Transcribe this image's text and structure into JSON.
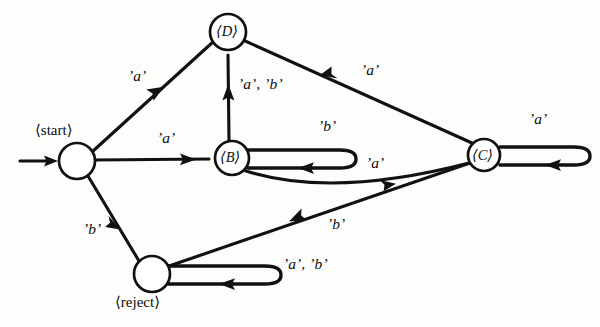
{
  "diagram": {
    "type": "state-diagram",
    "ink_color": "#111111",
    "background_color": "#fdfdfb",
    "states": [
      {
        "id": "start",
        "label": "⟨start⟩",
        "label_text": "start",
        "cx": 77,
        "cy": 161,
        "r": 18,
        "label_pos": "above"
      },
      {
        "id": "D",
        "label": "⟨D⟩",
        "label_text": "D",
        "cx": 228,
        "cy": 32,
        "r": 18,
        "label_pos": "inside"
      },
      {
        "id": "B",
        "label": "⟨B⟩",
        "label_text": "B",
        "cx": 232,
        "cy": 158,
        "r": 17,
        "label_pos": "inside"
      },
      {
        "id": "C",
        "label": "⟨C⟩",
        "label_text": "C",
        "cx": 484,
        "cy": 155,
        "r": 16,
        "label_pos": "inside"
      },
      {
        "id": "reject",
        "label": "⟨reject⟩",
        "label_text": "reject",
        "cx": 152,
        "cy": 274,
        "r": 18,
        "label_pos": "below"
      }
    ],
    "initial_arrow": {
      "from_x": 20,
      "to_x": 58,
      "y": 161
    },
    "transitions": [
      {
        "from": "start",
        "to": "D",
        "label": "’a’",
        "symbols": [
          "a"
        ],
        "label_x": 137,
        "label_y": 76,
        "shape": "straight"
      },
      {
        "from": "start",
        "to": "B",
        "label": "’a’",
        "symbols": [
          "a"
        ],
        "label_x": 166,
        "label_y": 138,
        "shape": "straight"
      },
      {
        "from": "start",
        "to": "reject",
        "label": "’b’",
        "symbols": [
          "b"
        ],
        "label_x": 92,
        "label_y": 229,
        "shape": "straight"
      },
      {
        "from": "B",
        "to": "D",
        "label": "’a’, ’b’",
        "symbols": [
          "a",
          "b"
        ],
        "label_x": 240,
        "label_y": 84,
        "shape": "straight"
      },
      {
        "from": "B",
        "to": "B",
        "label": "’b’",
        "symbols": [
          "b"
        ],
        "label_x": 323,
        "label_y": 126,
        "shape": "self-loop-right"
      },
      {
        "from": "B",
        "to": "C",
        "label": "’a’",
        "symbols": [
          "a"
        ],
        "label_x": 370,
        "label_y": 163,
        "shape": "curve"
      },
      {
        "from": "C",
        "to": "D",
        "label": "’a’",
        "symbols": [
          "a"
        ],
        "label_x": 366,
        "label_y": 70,
        "shape": "straight"
      },
      {
        "from": "C",
        "to": "C",
        "label": "’a’",
        "symbols": [
          "a"
        ],
        "label_x": 533,
        "label_y": 119,
        "shape": "self-loop-right"
      },
      {
        "from": "C",
        "to": "reject",
        "label": "’b’",
        "symbols": [
          "b"
        ],
        "label_x": 332,
        "label_y": 224,
        "shape": "straight"
      },
      {
        "from": "reject",
        "to": "reject",
        "label": "’a’, ’b’",
        "symbols": [
          "a",
          "b"
        ],
        "label_x": 286,
        "label_y": 263,
        "shape": "self-loop-right"
      }
    ]
  }
}
